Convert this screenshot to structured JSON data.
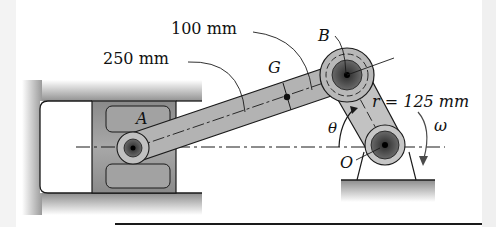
{
  "figure": {
    "type": "slider-crank mechanism",
    "labels": {
      "dim_rod_to_G": "250 mm",
      "dim_G_to_B": "100 mm",
      "crank_radius": "r = 125 mm",
      "point_A": "A",
      "point_B": "B",
      "point_G": "G",
      "point_O": "O",
      "angle": "θ",
      "angular_velocity": "ω"
    },
    "colors": {
      "background": "#ffffff",
      "metal_gray": "#9a9a9a",
      "link_gray": "#b4b4b4",
      "pin_dark": "#4a4a4a",
      "outline": "#1a1a1a"
    }
  }
}
